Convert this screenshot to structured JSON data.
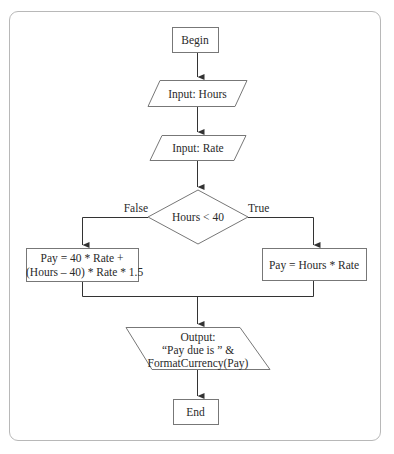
{
  "flowchart": {
    "begin": "Begin",
    "input_hours": "Input: Hours",
    "input_rate": "Input: Rate",
    "decision": "Hours < 40",
    "false_label": "False",
    "true_label": "True",
    "false_process_line1": "Pay = 40 * Rate +",
    "false_process_line2": "(Hours – 40) * Rate * 1.5",
    "true_process": "Pay = Hours * Rate",
    "output_line1": "Output:",
    "output_line2": "“Pay due is ” &",
    "output_line3": "FormatCurrency(Pay)",
    "end": "End"
  },
  "caption": "",
  "colors": {
    "stroke": "#555555",
    "frame": "#b8b8b8",
    "text": "#2a2a2a"
  }
}
